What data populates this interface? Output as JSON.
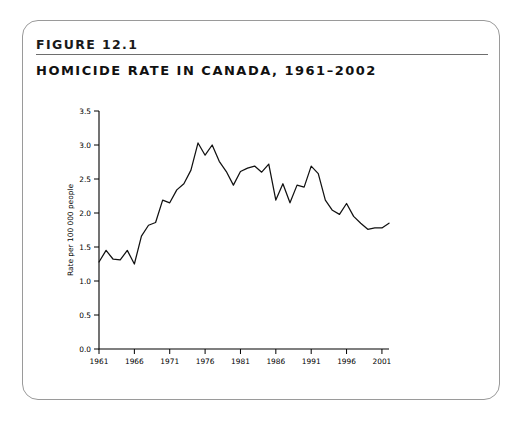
{
  "figure": {
    "number": "FIGURE 12.1",
    "title": "HOMICIDE RATE IN CANADA, 1961–2002"
  },
  "chart_data": {
    "type": "line",
    "title": "HOMICIDE RATE IN CANADA, 1961–2002",
    "xlabel": "",
    "ylabel": "Rate per 100 000 people",
    "xlim": [
      1961,
      2002
    ],
    "ylim": [
      0.0,
      3.5
    ],
    "grid": false,
    "legend": false,
    "x_ticks": [
      1961,
      1966,
      1971,
      1976,
      1981,
      1986,
      1991,
      1996,
      2001
    ],
    "x_tick_labels": [
      "1961",
      "1966",
      "1971",
      "1976",
      "1981",
      "1986",
      "1991",
      "1996",
      "2001"
    ],
    "y_ticks": [
      0.0,
      0.5,
      1.0,
      1.5,
      2.0,
      2.5,
      3.0,
      3.5
    ],
    "y_tick_labels": [
      "0.0",
      "0.5",
      "1.0",
      "1.5",
      "2.0",
      "2.5",
      "3.0",
      "3.5"
    ],
    "line_color": "#111111",
    "x": [
      1961,
      1962,
      1963,
      1964,
      1965,
      1966,
      1967,
      1968,
      1969,
      1970,
      1971,
      1972,
      1973,
      1974,
      1975,
      1976,
      1977,
      1978,
      1979,
      1980,
      1981,
      1982,
      1983,
      1984,
      1985,
      1986,
      1987,
      1988,
      1989,
      1990,
      1991,
      1992,
      1993,
      1994,
      1995,
      1996,
      1997,
      1998,
      1999,
      2000,
      2001,
      2002
    ],
    "values": [
      1.28,
      1.45,
      1.32,
      1.31,
      1.45,
      1.25,
      1.66,
      1.82,
      1.86,
      2.19,
      2.15,
      2.34,
      2.43,
      2.63,
      3.03,
      2.85,
      3.0,
      2.76,
      2.61,
      2.41,
      2.61,
      2.66,
      2.69,
      2.6,
      2.72,
      2.19,
      2.43,
      2.15,
      2.41,
      2.38,
      2.69,
      2.58,
      2.19,
      2.04,
      1.98,
      2.14,
      1.95,
      1.85,
      1.76,
      1.78,
      1.78,
      1.85
    ]
  }
}
